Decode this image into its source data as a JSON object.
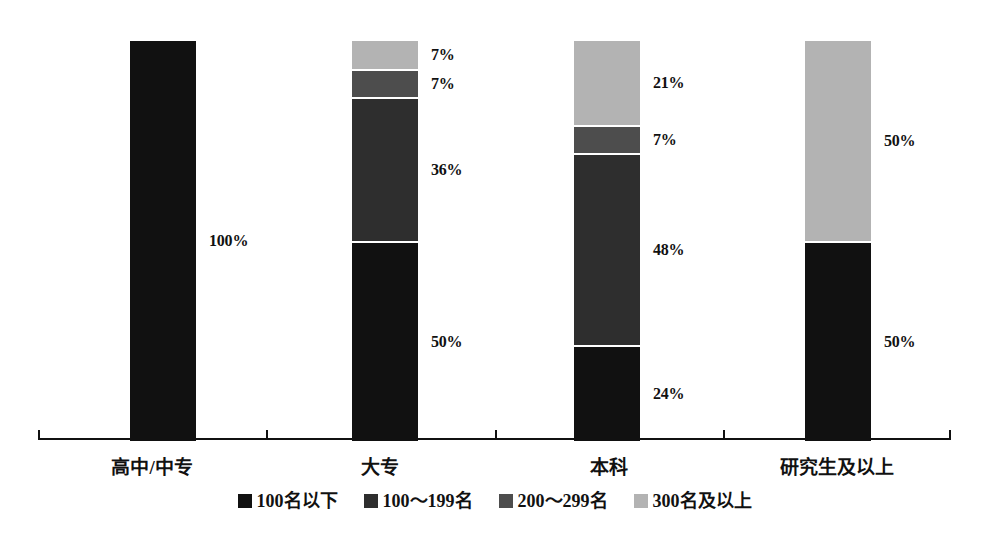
{
  "chart_data": {
    "type": "bar",
    "subtype": "100% stacked column",
    "title": "",
    "subtitle": "",
    "xlabel": "",
    "ylabel": "",
    "ylim": [
      0,
      100
    ],
    "grid": false,
    "legend_position": "bottom-center",
    "value_suffix": "%",
    "categories": [
      "高中/中专",
      "大专",
      "本科",
      "研究生及以上"
    ],
    "series": [
      {
        "name": "100名以下",
        "color": "#111111",
        "values": [
          100,
          50,
          24,
          50
        ],
        "labels": [
          "100%",
          "50%",
          "24%",
          "50%"
        ]
      },
      {
        "name": "100〜199名",
        "color": "#2e2e2e",
        "values": [
          0,
          36,
          48,
          0
        ],
        "labels": [
          "",
          "36%",
          "48%",
          ""
        ]
      },
      {
        "name": "200〜299名",
        "color": "#4d4d4d",
        "values": [
          0,
          7,
          7,
          0
        ],
        "labels": [
          "",
          "7%",
          "7%",
          ""
        ]
      },
      {
        "name": "300名及以上",
        "color": "#b3b3b3",
        "values": [
          0,
          7,
          21,
          50
        ],
        "labels": [
          "",
          "7%",
          "21%",
          "50%"
        ]
      }
    ]
  },
  "legend": {
    "items": [
      {
        "label": "100名以下",
        "color": "#111111"
      },
      {
        "label": "100〜199名",
        "color": "#2e2e2e"
      },
      {
        "label": "200〜299名",
        "color": "#4d4d4d"
      },
      {
        "label": "300名及以上",
        "color": "#b3b3b3"
      }
    ]
  },
  "axis": {
    "line_color": "#111111",
    "tick_count": 3
  },
  "layout": {
    "bar_left_px": [
      130,
      352,
      574,
      805
    ],
    "bar_width_px": 66,
    "bar_full_height_px": 400,
    "tick_x_pct": [
      25,
      50,
      75
    ],
    "cat_center_pct": [
      12.5,
      37.5,
      62.5,
      87.5
    ]
  }
}
